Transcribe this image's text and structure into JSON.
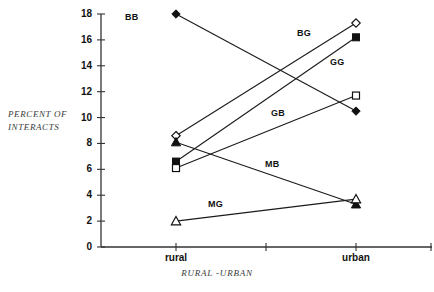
{
  "chart_data": {
    "type": "line",
    "title": "",
    "xlabel": "RURAL -URBAN",
    "ylabel_line1": "PERCENT OF",
    "ylabel_line2": "INTERACTS",
    "categories": [
      "rural",
      "urban"
    ],
    "ylim": [
      0,
      18
    ],
    "yticks": [
      0,
      2,
      4,
      6,
      8,
      10,
      12,
      14,
      16,
      18
    ],
    "ytick_labels": [
      "0",
      "2",
      "4",
      "6",
      "8",
      "10",
      "12",
      "14",
      "16",
      "18"
    ],
    "grid": false,
    "legend": "inline-annotations",
    "series": [
      {
        "name": "BB",
        "marker": "filled-diamond",
        "values": [
          18.0,
          10.5
        ],
        "label_x": 125,
        "label_y": 12
      },
      {
        "name": "BG",
        "marker": "open-diamond",
        "values": [
          8.6,
          17.3
        ],
        "label_x": 297,
        "label_y": 28
      },
      {
        "name": "GG",
        "marker": "filled-square",
        "values": [
          6.6,
          16.2
        ],
        "label_x": 330,
        "label_y": 57
      },
      {
        "name": "GB",
        "marker": "open-square",
        "values": [
          6.1,
          11.7
        ],
        "label_x": 271,
        "label_y": 108
      },
      {
        "name": "MB",
        "marker": "filled-triangle",
        "values": [
          8.1,
          3.3
        ],
        "label_x": 265,
        "label_y": 159
      },
      {
        "name": "MG",
        "marker": "open-triangle",
        "values": [
          2.0,
          3.7
        ],
        "label_x": 208,
        "label_y": 199
      }
    ],
    "annotations": [
      "BB",
      "BG",
      "GG",
      "GB",
      "MB",
      "MG"
    ],
    "colors": {
      "ink": "#111111",
      "axis": "#333333",
      "label": "#3a3a3a",
      "background": "#ffffff"
    }
  }
}
